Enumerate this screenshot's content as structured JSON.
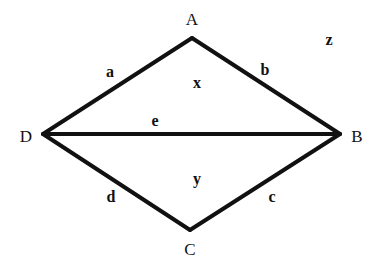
{
  "diagram": {
    "type": "graph",
    "vertices": [
      {
        "id": "A",
        "label": "A",
        "x": 192,
        "y": 38,
        "lx": 192,
        "ly": 25
      },
      {
        "id": "B",
        "label": "B",
        "x": 340,
        "y": 134,
        "lx": 357,
        "ly": 142
      },
      {
        "id": "C",
        "label": "C",
        "x": 190,
        "y": 230,
        "lx": 190,
        "ly": 255
      },
      {
        "id": "D",
        "label": "D",
        "x": 43,
        "y": 134,
        "lx": 26,
        "ly": 142
      }
    ],
    "edges": [
      {
        "id": "a",
        "label": "a",
        "from": "D",
        "to": "A",
        "lx": 110,
        "ly": 77
      },
      {
        "id": "b",
        "label": "b",
        "from": "A",
        "to": "B",
        "lx": 265,
        "ly": 75
      },
      {
        "id": "c",
        "label": "c",
        "from": "B",
        "to": "C",
        "lx": 272,
        "ly": 202
      },
      {
        "id": "d",
        "label": "d",
        "from": "C",
        "to": "D",
        "lx": 111,
        "ly": 202
      },
      {
        "id": "e",
        "label": "e",
        "from": "D",
        "to": "B",
        "lx": 155,
        "ly": 126
      }
    ],
    "regions": [
      {
        "id": "x",
        "label": "x",
        "lx": 197,
        "ly": 88
      },
      {
        "id": "y",
        "label": "y",
        "lx": 197,
        "ly": 184
      },
      {
        "id": "z",
        "label": "z",
        "lx": 329,
        "ly": 45
      }
    ]
  }
}
